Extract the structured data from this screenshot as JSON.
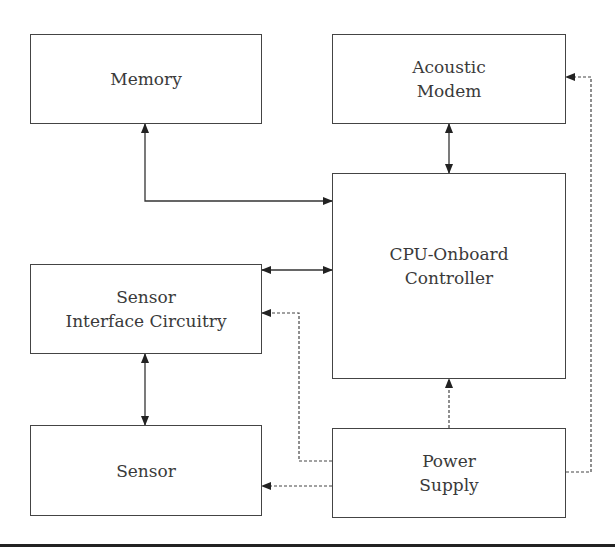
{
  "diagram": {
    "type": "block-diagram",
    "blocks": [
      {
        "id": "memory",
        "lines": [
          "Memory"
        ]
      },
      {
        "id": "acoustic_modem",
        "lines": [
          "Acoustic",
          "Modem"
        ]
      },
      {
        "id": "cpu",
        "lines": [
          "CPU-Onboard",
          "Controller"
        ]
      },
      {
        "id": "sensor_interface",
        "lines": [
          "Sensor",
          "Interface Circuitry"
        ]
      },
      {
        "id": "sensor",
        "lines": [
          "Sensor"
        ]
      },
      {
        "id": "power_supply",
        "lines": [
          "Power",
          "Supply"
        ]
      }
    ],
    "connections": [
      {
        "from": "memory",
        "to": "cpu",
        "style": "solid",
        "direction": "bidirectional"
      },
      {
        "from": "acoustic_modem",
        "to": "cpu",
        "style": "solid",
        "direction": "bidirectional"
      },
      {
        "from": "sensor_interface",
        "to": "cpu",
        "style": "solid",
        "direction": "bidirectional"
      },
      {
        "from": "sensor_interface",
        "to": "sensor",
        "style": "solid",
        "direction": "bidirectional"
      },
      {
        "from": "power_supply",
        "to": "cpu",
        "style": "dashed",
        "direction": "forward"
      },
      {
        "from": "power_supply",
        "to": "sensor_interface",
        "style": "dashed",
        "direction": "forward"
      },
      {
        "from": "power_supply",
        "to": "sensor",
        "style": "dashed",
        "direction": "forward"
      },
      {
        "from": "power_supply",
        "to": "acoustic_modem",
        "style": "dashed",
        "direction": "forward"
      }
    ]
  },
  "colors": {
    "line": "#333333",
    "box_border": "#444444",
    "text": "#3a3a3a"
  }
}
